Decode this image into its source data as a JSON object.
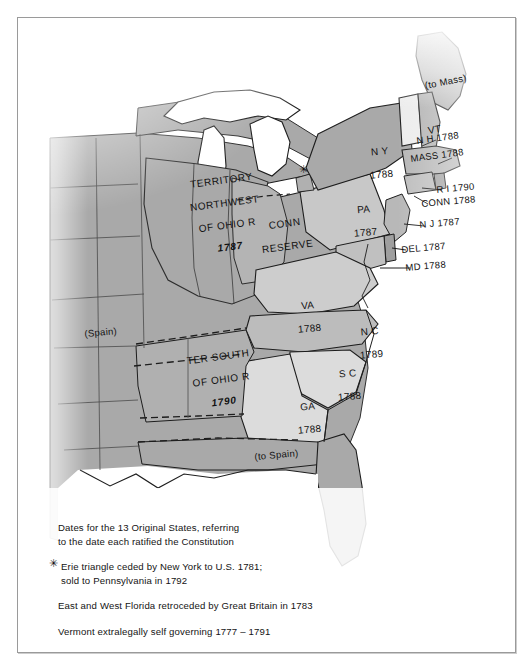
{
  "figure": {
    "kind": "historical-map",
    "region": "Eastern United States, circa 1790"
  },
  "palette": {
    "land_gray": "#a8a8a8",
    "land_light": "#d8d8d8",
    "water_white": "#ffffff",
    "ink": "#111111",
    "frame": "#9a9a9a",
    "page": "#ffffff"
  },
  "map_labels": [
    {
      "id": "territory-northwest",
      "lines": [
        "TERRITORY",
        "NORTHWEST",
        "OF OHIO R"
      ],
      "year": "1787",
      "x": 158,
      "y": 162,
      "style": "territory"
    },
    {
      "id": "conn-reserve",
      "lines": [
        "CONN",
        "RESERVE"
      ],
      "year": "",
      "x": 227,
      "y": 204,
      "style": "territory"
    },
    {
      "id": "ter-south-of-ohio",
      "lines": [
        "TER SOUTH",
        "OF OHIO R"
      ],
      "year": "1790",
      "x": 160,
      "y": 338,
      "style": "territory"
    },
    {
      "id": "new-york",
      "text": "N Y",
      "year": "1788",
      "x": 337,
      "y": 127,
      "style": "state"
    },
    {
      "id": "pennsylvania",
      "text": "PA",
      "year": "1787",
      "x": 318,
      "y": 185,
      "style": "state"
    },
    {
      "id": "virginia",
      "text": "VA",
      "year": "1788",
      "x": 260,
      "y": 281,
      "style": "state"
    },
    {
      "id": "north-carolina",
      "text": "N C",
      "year": "1789",
      "x": 325,
      "y": 307,
      "style": "state"
    },
    {
      "id": "south-carolina",
      "text": "S C",
      "year": "1788",
      "x": 302,
      "y": 349,
      "style": "state"
    },
    {
      "id": "georgia",
      "text": "GA",
      "year": "1788",
      "x": 262,
      "y": 382,
      "style": "state"
    },
    {
      "id": "vermont",
      "text": "VT",
      "year": "",
      "x": 389,
      "y": 107,
      "style": "state"
    },
    {
      "id": "new-hampshire",
      "text": "N H 1788",
      "x": 404,
      "y": 125,
      "style": "inline"
    },
    {
      "id": "massachusetts",
      "text": "MASS 1788",
      "x": 398,
      "y": 143,
      "style": "inline"
    },
    {
      "id": "rhode-island",
      "text": "R I 1790",
      "x": 424,
      "y": 174,
      "style": "inline"
    },
    {
      "id": "connecticut",
      "text": "CONN 1788",
      "x": 409,
      "y": 187,
      "style": "inline"
    },
    {
      "id": "new-jersey",
      "text": "N J 1787",
      "x": 407,
      "y": 209,
      "style": "inline"
    },
    {
      "id": "delaware",
      "text": "DEL 1787",
      "x": 389,
      "y": 234,
      "style": "inline"
    },
    {
      "id": "maryland",
      "text": "MD 1788",
      "x": 393,
      "y": 252,
      "style": "inline"
    },
    {
      "id": "to-mass",
      "text": "(to Mass)",
      "x": 412,
      "y": 70,
      "style": "paren"
    },
    {
      "id": "spain-west",
      "text": "(Spain)",
      "x": 72,
      "y": 318,
      "style": "paren"
    },
    {
      "id": "to-spain-gulf",
      "text": "(to Spain)",
      "x": 242,
      "y": 441,
      "style": "paren"
    }
  ],
  "erie_star": {
    "id": "erie-triangle-star",
    "glyph": "✳",
    "x": 287,
    "y": 152
  },
  "legend": {
    "entries": [
      {
        "id": "legend-dates",
        "starred": false,
        "lines": [
          "Dates for the 13 Original States, referring",
          "to the date each ratified the Constitution"
        ]
      },
      {
        "id": "legend-erie-triangle",
        "starred": true,
        "star_glyph": "✳",
        "lines": [
          "Erie triangle ceded by New York to U.S. 1781;",
          "sold to Pennsylvania in 1792"
        ]
      },
      {
        "id": "legend-florida",
        "starred": false,
        "lines": [
          "East and West Florida retroceded by Great Britain in 1783"
        ]
      },
      {
        "id": "legend-vermont",
        "starred": false,
        "lines": [
          "Vermont extralegally self governing 1777 – 1791"
        ]
      }
    ]
  }
}
